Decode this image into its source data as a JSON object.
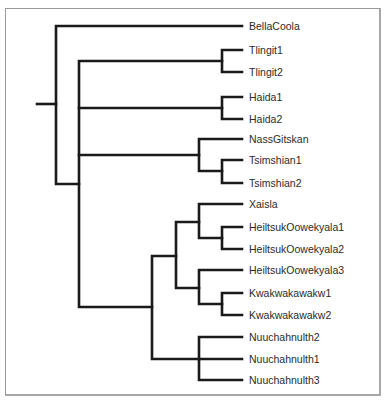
{
  "diagram": {
    "type": "phylogenetic-tree",
    "orientation": "left-to-right",
    "branch_color": "#1a1a1a",
    "label_color": "#2b2b2b",
    "frame_color": "#9a9a9a",
    "leaves": [
      {
        "id": "BellaCoola",
        "label": "BellaCoola",
        "y": 26
      },
      {
        "id": "Tlingit1",
        "label": "Tlingit1",
        "y": 50
      },
      {
        "id": "Tlingit2",
        "label": "Tlingit2",
        "y": 72
      },
      {
        "id": "Haida1",
        "label": "Haida1",
        "y": 97
      },
      {
        "id": "Haida2",
        "label": "Haida2",
        "y": 119
      },
      {
        "id": "NassGitskan",
        "label": "NassGitskan",
        "y": 139
      },
      {
        "id": "Tsimshian1",
        "label": "Tsimshian1",
        "y": 160
      },
      {
        "id": "Tsimshian2",
        "label": "Tsimshian2",
        "y": 183
      },
      {
        "id": "Xaisla",
        "label": "Xaisla",
        "y": 204
      },
      {
        "id": "HeiltsukOowekyala1",
        "label": "HeiltsukOowekyala1",
        "y": 227
      },
      {
        "id": "HeiltsukOowekyala2",
        "label": "HeiltsukOowekyala2",
        "y": 249
      },
      {
        "id": "HeiltsukOowekyala3",
        "label": "HeiltsukOowekyala3",
        "y": 270
      },
      {
        "id": "Kwakwakawakw1",
        "label": "Kwakwakawakw1",
        "y": 293
      },
      {
        "id": "Kwakwakawakw2",
        "label": "Kwakwakawakw2",
        "y": 315
      },
      {
        "id": "Nuuchahnulth2",
        "label": "Nuuchahnulth2",
        "y": 337
      },
      {
        "id": "Nuuchahnulth1",
        "label": "Nuuchahnulth1",
        "y": 359
      },
      {
        "id": "Nuuchahnulth3",
        "label": "Nuuchahnulth3",
        "y": 380
      }
    ],
    "newick": "(BellaCoola,((Tlingit1,Tlingit2),(Haida1,Haida2),(NassGitskan,(Tsimshian1,Tsimshian2)),((Xaisla,(HeiltsukOowekyala1,HeiltsukOowekyala2)),(HeiltsukOowekyala3,(Kwakwakawakw1,Kwakwakawakw2))),(Nuuchahnulth2,Nuuchahnulth1,Nuuchahnulth3))));",
    "label_x": 249,
    "leaf_x": 242
  }
}
